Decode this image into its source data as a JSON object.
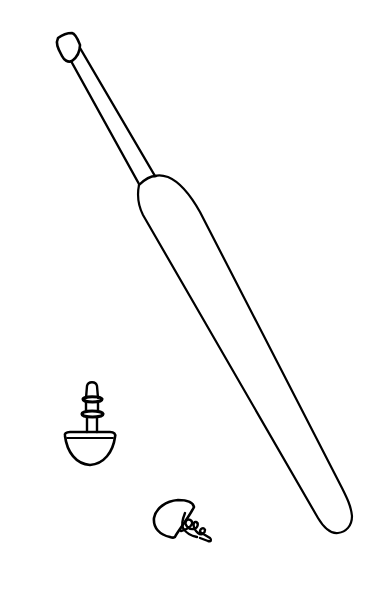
{
  "illustration": {
    "style": "black line drawing on white background",
    "background_color": "#ffffff",
    "stroke_color": "#000000",
    "objects": [
      {
        "id": "crochet-hook",
        "label": "crochet hook with ergonomic handle"
      },
      {
        "id": "safety-eye-upright",
        "label": "safety eye, upright"
      },
      {
        "id": "safety-eye-tilted",
        "label": "safety eye, tilted"
      }
    ]
  }
}
